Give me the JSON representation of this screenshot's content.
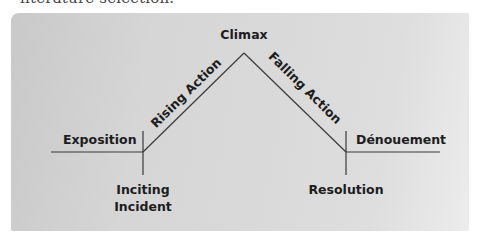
{
  "page": {
    "preceding_text": "literature selection."
  },
  "diagram": {
    "labels": {
      "climax": "Climax",
      "rising_action": "Rising Action",
      "falling_action": "Falling Action",
      "exposition": "Exposition",
      "denouement": "Dénouement",
      "inciting_incident_line1": "Inciting",
      "inciting_incident_line2": "Incident",
      "resolution": "Resolution"
    },
    "colors": {
      "panel": "#d6d6d6",
      "line": "#3a3a3a",
      "text": "#1d1d1d"
    }
  }
}
